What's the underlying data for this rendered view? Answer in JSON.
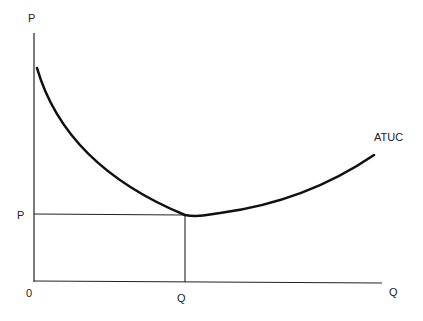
{
  "diagram": {
    "type": "economics-cost-curve",
    "labels": {
      "y_axis": "P",
      "x_axis": "Q",
      "origin": "0",
      "price_level": "P",
      "quantity_level": "Q",
      "curve": "ATUC"
    },
    "colors": {
      "ink": "#111111",
      "background": "#ffffff"
    }
  }
}
